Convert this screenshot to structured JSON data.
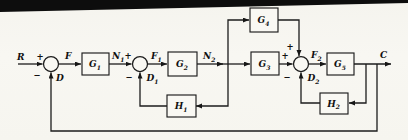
{
  "diagram": {
    "kind": "control-system-block-diagram (scanned textbook figure)",
    "colors": {
      "paper": "#f7f6f1",
      "ink": "#1c1c1c",
      "scan_bar": "#0d0d0d"
    },
    "blocks": {
      "G1": {
        "base": "G",
        "sub": "1"
      },
      "G2": {
        "base": "G",
        "sub": "2"
      },
      "G3": {
        "base": "G",
        "sub": "3"
      },
      "G4": {
        "base": "G",
        "sub": "4"
      },
      "G5": {
        "base": "G",
        "sub": "5"
      },
      "H1": {
        "base": "H",
        "sub": "1"
      },
      "H2": {
        "base": "H",
        "sub": "2"
      }
    },
    "labels": {
      "R": {
        "base": "R",
        "sub": ""
      },
      "F": {
        "base": "F",
        "sub": ""
      },
      "N1": {
        "base": "N",
        "sub": "1"
      },
      "F1": {
        "base": "F",
        "sub": "1"
      },
      "N2": {
        "base": "N",
        "sub": "2"
      },
      "F2": {
        "base": "F",
        "sub": "2"
      },
      "C": {
        "base": "C",
        "sub": ""
      },
      "D": {
        "base": "D",
        "sub": ""
      },
      "D1": {
        "base": "D",
        "sub": "1"
      },
      "D2": {
        "base": "D",
        "sub": "2"
      }
    },
    "signs": {
      "plus": "+",
      "minus": "−"
    },
    "connections": [
      "R → sum1(+)",
      "sum1 → F → G1",
      "G1 → N1 → sum2(+)",
      "sum2 → F1 → G2",
      "G2 → N2 → branch node",
      "branch node → G4 (upper path)",
      "branch node → G3 (main path)",
      "branch node → H1 → sum2(−) as D1",
      "G4 → sum3(+ top)",
      "G3 → sum3(+)",
      "sum3 → F2 → G5",
      "G5 → C (output)",
      "C tap → H2 → sum3(−) as D2",
      "C tap → outer loop → sum1(−) as D"
    ]
  }
}
